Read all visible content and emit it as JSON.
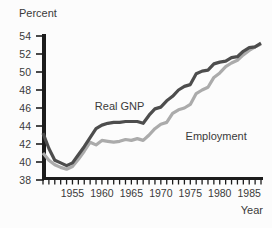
{
  "figure": {
    "background": "#fcfcfc"
  },
  "chart_data": {
    "type": "line",
    "title": "",
    "ylabel": "Percent",
    "xlabel": "Year",
    "ylim": [
      38,
      54
    ],
    "yticks": [
      38,
      40,
      42,
      44,
      46,
      48,
      50,
      52,
      54
    ],
    "xticks_labeled": [
      1955,
      1960,
      1965,
      1970,
      1975,
      1980,
      1985
    ],
    "grid": false,
    "legend_position": "inline-annotations",
    "axis_color": "#1c1c1c",
    "text_color": "#3a3a3a",
    "years": [
      1950,
      1951,
      1952,
      1953,
      1954,
      1955,
      1956,
      1957,
      1958,
      1959,
      1960,
      1961,
      1962,
      1963,
      1964,
      1965,
      1966,
      1967,
      1968,
      1969,
      1970,
      1971,
      1972,
      1973,
      1974,
      1975,
      1976,
      1977,
      1978,
      1979,
      1980,
      1981,
      1982,
      1983,
      1984,
      1985,
      1986,
      1987
    ],
    "series": [
      {
        "name": "Real GNP",
        "color": "#4d4d4d",
        "values": [
          43.2,
          41.5,
          40.2,
          39.9,
          39.6,
          39.9,
          40.8,
          41.7,
          42.7,
          43.7,
          44.1,
          44.3,
          44.4,
          44.4,
          44.5,
          44.5,
          44.5,
          44.3,
          45.2,
          45.9,
          46.1,
          46.8,
          47.3,
          48.0,
          48.4,
          48.6,
          49.8,
          50.1,
          50.2,
          50.9,
          51.1,
          51.2,
          51.6,
          51.7,
          52.3,
          52.7,
          52.8,
          53.2
        ]
      },
      {
        "name": "Employment",
        "color": "#ababab",
        "values": [
          41.0,
          40.2,
          39.7,
          39.4,
          39.2,
          39.5,
          40.3,
          41.2,
          42.2,
          41.9,
          42.4,
          42.3,
          42.2,
          42.3,
          42.5,
          42.4,
          42.6,
          42.4,
          43.0,
          43.7,
          44.2,
          44.4,
          45.4,
          45.8,
          46.0,
          46.4,
          47.6,
          48.0,
          48.3,
          49.4,
          49.9,
          50.6,
          51.0,
          51.3,
          51.9,
          52.4,
          52.8,
          53.1
        ]
      }
    ],
    "annotations": [
      {
        "text": "Real GNP",
        "x": 1958.8,
        "y": 45.8,
        "anchor": "start"
      },
      {
        "text": "Employment",
        "x": 1974.2,
        "y": 42.5,
        "anchor": "start"
      }
    ]
  }
}
